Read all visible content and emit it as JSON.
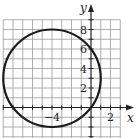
{
  "chart_data": {
    "type": "line",
    "title": "",
    "xlabel": "x",
    "ylabel": "y",
    "xlim": [
      -9,
      3
    ],
    "ylim": [
      -3,
      9
    ],
    "grid": true,
    "grid_step": 1,
    "x_tick_labels": [
      {
        "value": -4,
        "label": "−4"
      },
      {
        "value": 2,
        "label": "2"
      }
    ],
    "y_tick_labels": [
      {
        "value": 2,
        "label": "2"
      },
      {
        "value": 4,
        "label": "4"
      },
      {
        "value": 6,
        "label": "6"
      },
      {
        "value": 8,
        "label": "8"
      }
    ],
    "series": [
      {
        "name": "circle",
        "shape": "circle",
        "center": [
          -4,
          3
        ],
        "radius": 5,
        "color": "#1a1a1a"
      }
    ]
  }
}
